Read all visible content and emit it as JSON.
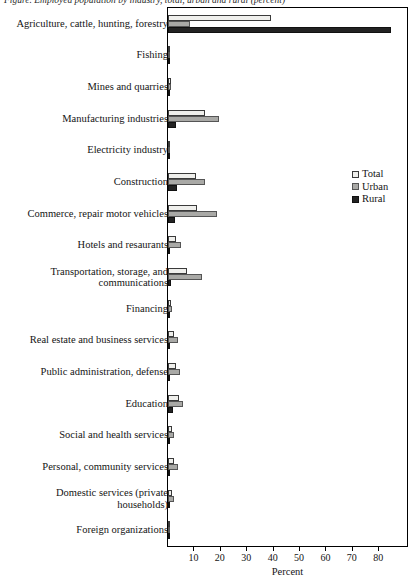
{
  "caption": "Figure. Employed population by industry, total, urban and rural (percent)",
  "chart_data": {
    "type": "bar",
    "orientation": "horizontal",
    "title": "",
    "xlabel": "Percent",
    "ylabel": "",
    "xlim": [
      0,
      90.5
    ],
    "xticks": [
      10,
      20,
      30,
      40,
      50,
      60,
      70,
      80
    ],
    "grid": false,
    "legend_position": "right-middle",
    "categories": [
      "Agriculture, cattle, hunting, forestry",
      "Fishing",
      "Mines and quarries",
      "Manufacturing industries",
      "Electricity industry",
      "Construction",
      "Commerce, repair motor vehicles",
      "Hotels and resaurants",
      "Transportation, storage, and communications",
      "Financing",
      "Real estate and business services",
      "Public administration, defense",
      "Education",
      "Social and health services",
      "Personal, community services",
      "Domestic services (private households)",
      "Foreign organizations"
    ],
    "series": [
      {
        "name": "Total",
        "color": "#efefec",
        "values": [
          39.0,
          0.3,
          1.0,
          14.0,
          0.3,
          10.5,
          10.8,
          3.0,
          7.2,
          1.0,
          2.2,
          3.0,
          4.2,
          1.6,
          2.2,
          1.6,
          0.2
        ]
      },
      {
        "name": "Urban",
        "color": "#a9a9a6",
        "values": [
          8.2,
          0.2,
          1.2,
          19.5,
          0.4,
          14.0,
          18.5,
          5.0,
          13.0,
          1.5,
          3.6,
          4.6,
          5.6,
          2.2,
          3.6,
          2.4,
          0.3
        ]
      },
      {
        "name": "Rural",
        "color": "#232323",
        "values": [
          84.5,
          0.2,
          0.7,
          3.0,
          0.1,
          3.5,
          2.6,
          0.6,
          1.2,
          0.1,
          0.3,
          0.9,
          2.0,
          0.5,
          0.7,
          0.6,
          0.1
        ]
      }
    ]
  },
  "legend": {
    "items": [
      {
        "label": "Total",
        "swatch": "total"
      },
      {
        "label": "Urban",
        "swatch": "urban"
      },
      {
        "label": "Rural",
        "swatch": "rural"
      }
    ]
  }
}
